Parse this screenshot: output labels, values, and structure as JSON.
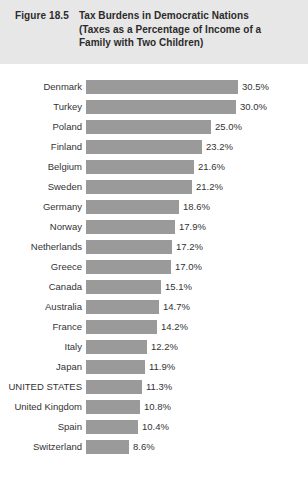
{
  "header": {
    "figure_number": "Figure 18.5",
    "title_lines": [
      "Tax Burdens in Democratic Nations",
      "(Taxes as a Percentage of Income of a",
      "Family with Two Children)"
    ],
    "band_color": "#e7e7e7",
    "text_color": "#2b2b2b"
  },
  "colors": {
    "bar_fill": "#9a9a9a",
    "background": "#ffffff",
    "label_text": "#333333"
  },
  "chart_data": {
    "type": "bar",
    "orientation": "horizontal",
    "title": "Tax Burdens in Democratic Nations",
    "subtitle": "(Taxes as a Percentage of Income of a Family with Two Children)",
    "xlabel": "",
    "ylabel": "",
    "xlim": [
      0,
      30.5
    ],
    "grid": false,
    "legend": false,
    "value_suffix": "%",
    "sorted": "descending",
    "categories": [
      "Denmark",
      "Turkey",
      "Poland",
      "Finland",
      "Belgium",
      "Sweden",
      "Germany",
      "Norway",
      "Netherlands",
      "Greece",
      "Canada",
      "Australia",
      "France",
      "Italy",
      "Japan",
      "UNITED STATES",
      "United Kingdom",
      "Spain",
      "Switzerland"
    ],
    "values": [
      30.5,
      30.0,
      25.0,
      23.2,
      21.6,
      21.2,
      18.6,
      17.9,
      17.2,
      17.0,
      15.1,
      14.7,
      14.2,
      12.2,
      11.9,
      11.3,
      10.8,
      10.4,
      8.6
    ],
    "value_labels": [
      "30.5%",
      "30.0%",
      "25.0%",
      "23.2%",
      "21.6%",
      "21.2%",
      "18.6%",
      "17.9%",
      "17.2%",
      "17.0%",
      "15.1%",
      "14.7%",
      "14.2%",
      "12.2%",
      "11.9%",
      "11.3%",
      "10.8%",
      "10.4%",
      "8.6%"
    ]
  }
}
